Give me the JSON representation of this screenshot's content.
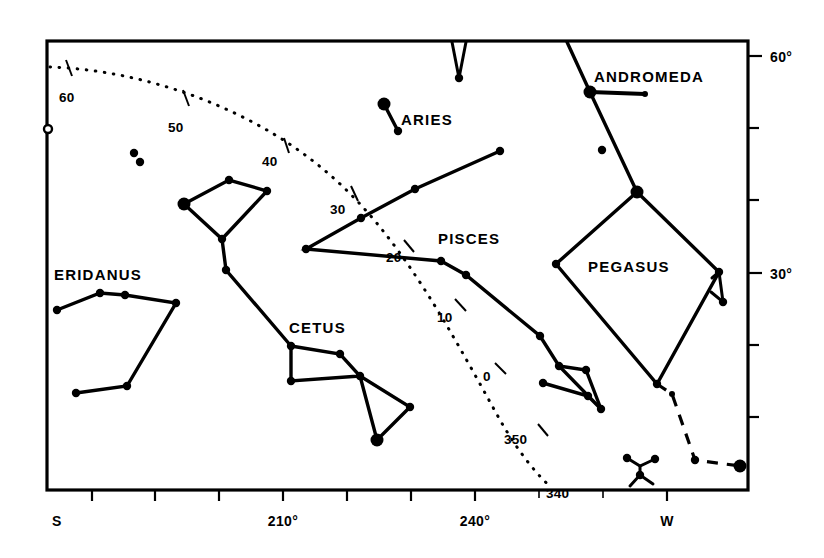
{
  "figure": {
    "background": "#ffffff",
    "ink": "#000000",
    "width": 824,
    "height": 558
  },
  "plot_frame": {
    "x": 47,
    "y": 41,
    "width": 701,
    "height": 449
  },
  "axes": {
    "bottom": {
      "label_S": "S",
      "label_W": "W",
      "ticks": [
        {
          "x": 92,
          "label": ""
        },
        {
          "x": 155,
          "label": ""
        },
        {
          "x": 219,
          "label": ""
        },
        {
          "x": 283,
          "label": "210°"
        },
        {
          "x": 347,
          "label": ""
        },
        {
          "x": 411,
          "label": ""
        },
        {
          "x": 475,
          "label": "240°"
        },
        {
          "x": 539,
          "label": ""
        },
        {
          "x": 603,
          "label": ""
        },
        {
          "x": 667,
          "label": "W"
        }
      ],
      "S_x": 52,
      "W_x": 667
    },
    "right": {
      "ticks": [
        {
          "y": 56,
          "label": "60°"
        },
        {
          "y": 128,
          "label": ""
        },
        {
          "y": 200,
          "label": ""
        },
        {
          "y": 273,
          "label": "30°"
        },
        {
          "y": 345,
          "label": ""
        },
        {
          "y": 417,
          "label": ""
        }
      ]
    }
  },
  "chart_data": {
    "type": "scatter",
    "xlabel": "Azimuth",
    "ylabel": "Altitude",
    "xlim": [
      195,
      285
    ],
    "ylim": [
      0,
      65
    ],
    "grid": false,
    "legend": "none",
    "constellations": [
      {
        "name": "ANDROMEDA",
        "label_x": 594,
        "label_y": 76
      },
      {
        "name": "ARIES",
        "label_x": 401,
        "label_y": 119
      },
      {
        "name": "PISCES",
        "label_x": 438,
        "label_y": 238
      },
      {
        "name": "PEGASUS",
        "label_x": 588,
        "label_y": 266
      },
      {
        "name": "ERIDANUS",
        "label_x": 54,
        "label_y": 274
      },
      {
        "name": "CETUS",
        "label_x": 289,
        "label_y": 327
      }
    ],
    "ecliptic": {
      "style": "dotted",
      "tick_labels": [
        {
          "value": "60",
          "x": 59,
          "y": 96
        },
        {
          "value": "50",
          "x": 168,
          "y": 126
        },
        {
          "value": "40",
          "x": 262,
          "y": 160
        },
        {
          "value": "30",
          "x": 330,
          "y": 208
        },
        {
          "value": "20",
          "x": 387,
          "y": 256
        },
        {
          "value": "10",
          "x": 440,
          "y": 318
        },
        {
          "value": "0",
          "x": 484,
          "y": 375
        },
        {
          "value": "350",
          "x": 505,
          "y": 440
        },
        {
          "value": "340",
          "x": 548,
          "y": 494
        }
      ]
    },
    "markers": {
      "bright_radius": 6.5,
      "medium_radius": 4.2,
      "small_radius": 3.0
    }
  },
  "stars": [
    {
      "name": "eridanus-a",
      "x": 57,
      "y": 310,
      "size": "medium"
    },
    {
      "name": "eridanus-b",
      "x": 100,
      "y": 293,
      "size": "medium"
    },
    {
      "name": "eridanus-c",
      "x": 125,
      "y": 295,
      "size": "medium"
    },
    {
      "name": "eridanus-d",
      "x": 176,
      "y": 303,
      "size": "medium"
    },
    {
      "name": "eridanus-e",
      "x": 127,
      "y": 386,
      "size": "medium"
    },
    {
      "name": "eridanus-f",
      "x": 76,
      "y": 393,
      "size": "medium"
    },
    {
      "name": "field-a",
      "x": 134,
      "y": 153,
      "size": "medium"
    },
    {
      "name": "field-b",
      "x": 140,
      "y": 162,
      "size": "medium"
    },
    {
      "name": "trapezium-a",
      "x": 184,
      "y": 204,
      "size": "bright"
    },
    {
      "name": "trapezium-b",
      "x": 229,
      "y": 180,
      "size": "medium"
    },
    {
      "name": "trapezium-c",
      "x": 267,
      "y": 191,
      "size": "medium"
    },
    {
      "name": "trapezium-d",
      "x": 222,
      "y": 239,
      "size": "medium"
    },
    {
      "name": "trapezium-e",
      "x": 226,
      "y": 270,
      "size": "medium"
    },
    {
      "name": "cetus-a",
      "x": 291,
      "y": 346,
      "size": "medium"
    },
    {
      "name": "cetus-b",
      "x": 340,
      "y": 354,
      "size": "medium"
    },
    {
      "name": "cetus-c",
      "x": 291,
      "y": 381,
      "size": "medium"
    },
    {
      "name": "cetus-d",
      "x": 360,
      "y": 376,
      "size": "medium"
    },
    {
      "name": "cetus-e",
      "x": 410,
      "y": 407,
      "size": "medium"
    },
    {
      "name": "cetus-f",
      "x": 377,
      "y": 440,
      "size": "bright"
    },
    {
      "name": "pisces-a",
      "x": 500,
      "y": 151,
      "size": "medium"
    },
    {
      "name": "pisces-b",
      "x": 415,
      "y": 189,
      "size": "medium"
    },
    {
      "name": "pisces-c",
      "x": 361,
      "y": 218,
      "size": "medium"
    },
    {
      "name": "pisces-d",
      "x": 306,
      "y": 249,
      "size": "medium"
    },
    {
      "name": "pisces-e",
      "x": 441,
      "y": 261,
      "size": "medium"
    },
    {
      "name": "pisces-f",
      "x": 466,
      "y": 275,
      "size": "medium"
    },
    {
      "name": "pisces-g",
      "x": 540,
      "y": 336,
      "size": "medium"
    },
    {
      "name": "pisces-h",
      "x": 559,
      "y": 366,
      "size": "medium"
    },
    {
      "name": "pisces-i",
      "x": 586,
      "y": 370,
      "size": "medium"
    },
    {
      "name": "pisces-j",
      "x": 543,
      "y": 383,
      "size": "medium"
    },
    {
      "name": "pisces-k",
      "x": 588,
      "y": 396,
      "size": "medium"
    },
    {
      "name": "pisces-l",
      "x": 601,
      "y": 409,
      "size": "medium"
    },
    {
      "name": "aries-a",
      "x": 384,
      "y": 104,
      "size": "bright"
    },
    {
      "name": "aries-b",
      "x": 398,
      "y": 131,
      "size": "medium"
    },
    {
      "name": "perseus-a",
      "x": 459,
      "y": 78,
      "size": "medium"
    },
    {
      "name": "andromeda-a",
      "x": 590,
      "y": 92,
      "size": "bright"
    },
    {
      "name": "andromeda-b",
      "x": 645,
      "y": 94,
      "size": "small"
    },
    {
      "name": "andromeda-c",
      "x": 602,
      "y": 150,
      "size": "medium"
    },
    {
      "name": "andromeda-d",
      "x": 637,
      "y": 192,
      "size": "bright"
    },
    {
      "name": "pegasus-a",
      "x": 556,
      "y": 264,
      "size": "medium"
    },
    {
      "name": "pegasus-b",
      "x": 657,
      "y": 384,
      "size": "medium"
    },
    {
      "name": "pegasus-c",
      "x": 719,
      "y": 272,
      "size": "medium"
    },
    {
      "name": "pegasus-d",
      "x": 723,
      "y": 302,
      "size": "medium"
    },
    {
      "name": "tail-a",
      "x": 695,
      "y": 460,
      "size": "medium"
    },
    {
      "name": "tail-b",
      "x": 740,
      "y": 466,
      "size": "bright"
    },
    {
      "name": "tail-c",
      "x": 672,
      "y": 394,
      "size": "small"
    },
    {
      "name": "grus-a",
      "x": 627,
      "y": 458,
      "size": "medium"
    },
    {
      "name": "grus-b",
      "x": 655,
      "y": 459,
      "size": "medium"
    },
    {
      "name": "grus-c",
      "x": 640,
      "y": 475,
      "size": "medium"
    }
  ]
}
